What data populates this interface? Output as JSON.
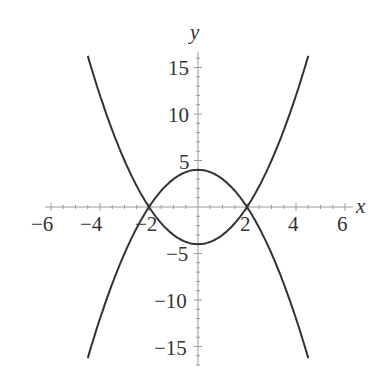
{
  "chart_data": {
    "type": "line",
    "title": "",
    "xlabel": "x",
    "ylabel": "y",
    "xlim": [
      -6.2,
      6.3
    ],
    "ylim": [
      -17,
      16.7
    ],
    "grid": false,
    "legend": null,
    "x_ticks": [
      "-6",
      "-4",
      "-2",
      "2",
      "4",
      "6"
    ],
    "y_ticks": [
      "15",
      "10",
      "5",
      "-5",
      "-10",
      "-15"
    ],
    "series": [
      {
        "name": "y = x^2 - 4",
        "x": [
          -4.5,
          -4,
          -3,
          -2,
          -1,
          0,
          1,
          2,
          3,
          4,
          4.5
        ],
        "y": [
          16.25,
          12,
          5,
          0,
          -3,
          -4,
          -3,
          0,
          5,
          12,
          16.25
        ]
      },
      {
        "name": "y = 4 - x^2",
        "x": [
          -4.5,
          -4,
          -3,
          -2,
          -1,
          0,
          1,
          2,
          3,
          4,
          4.5
        ],
        "y": [
          -16.25,
          -12,
          -5,
          0,
          3,
          4,
          3,
          0,
          -5,
          -12,
          -16.25
        ]
      }
    ],
    "annotations": []
  },
  "axes": {
    "x_label": "x",
    "y_label": "y",
    "x_tick_labels": [
      "−6",
      "−4",
      "−2",
      "2",
      "4",
      "6"
    ],
    "y_tick_labels": [
      "15",
      "10",
      "5",
      "−5",
      "−10",
      "−15"
    ]
  }
}
